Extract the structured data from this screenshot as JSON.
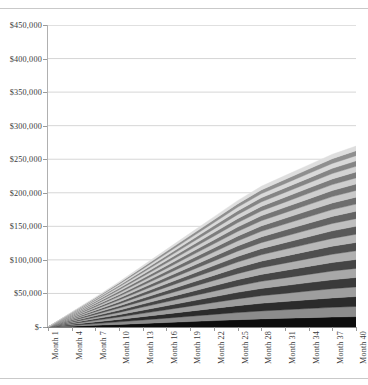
{
  "chart_data": {
    "type": "area",
    "stacked": true,
    "title": "",
    "subtitle": "",
    "xlabel": "",
    "ylabel": "",
    "grid": true,
    "grid_axis": "y",
    "legend_position": "none",
    "ylim": [
      0,
      450000
    ],
    "ytick_step": 50000,
    "ytick_labels": [
      "$450,000",
      "$400,000",
      "$350,000",
      "$300,000",
      "$250,000",
      "$200,000",
      "$150,000",
      "$100,000",
      "$50,000",
      "$-"
    ],
    "ytick_values": [
      450000,
      400000,
      350000,
      300000,
      250000,
      200000,
      150000,
      100000,
      50000,
      0
    ],
    "xtick_labels": [
      "Month 1",
      "Month 4",
      "Month 7",
      "Month 10",
      "Month 13",
      "Month 16",
      "Month 19",
      "Month 22",
      "Month 25",
      "Month 28",
      "Month 31",
      "Month 34",
      "Month 37",
      "Month 40"
    ],
    "xtick_values": [
      1,
      4,
      7,
      10,
      13,
      16,
      19,
      22,
      25,
      28,
      31,
      34,
      37,
      40
    ],
    "x_range": [
      1,
      40
    ],
    "x": [
      1,
      4,
      7,
      10,
      13,
      16,
      19,
      22,
      25,
      28,
      31,
      34,
      37,
      40
    ],
    "total_at_x": [
      0,
      30000,
      61000,
      93000,
      127000,
      162000,
      197000,
      233000,
      269000,
      302000,
      327000,
      352000,
      377000,
      398000
    ],
    "series_count": 24,
    "series_colors": [
      "#0d0d0d",
      "#8c8c8c",
      "#2b2b2b",
      "#9e9e9e",
      "#3a3a3a",
      "#a8a8a8",
      "#454545",
      "#b0b0b0",
      "#4f4f4f",
      "#b8b8b8",
      "#595959",
      "#bfbfbf",
      "#636363",
      "#c4c4c4",
      "#6d6d6d",
      "#c9c9c9",
      "#757575",
      "#cfcfcf",
      "#7d7d7d",
      "#d4d4d4",
      "#858585",
      "#d9d9d9",
      "#8f8f8f",
      "#dedede"
    ],
    "series": [
      {
        "name": "Series 1",
        "values": [
          0,
          1300,
          2600,
          3900,
          5300,
          6700,
          8100,
          9500,
          10900,
          12100,
          13000,
          13900,
          14800,
          15500
        ]
      },
      {
        "name": "Series 2",
        "values": [
          0,
          1250,
          2500,
          3780,
          5150,
          6520,
          7880,
          9250,
          10600,
          11800,
          12700,
          13600,
          14450,
          15150
        ]
      },
      {
        "name": "Series 3",
        "values": [
          0,
          1210,
          2420,
          3660,
          4990,
          6320,
          7640,
          8970,
          10300,
          11450,
          12320,
          13200,
          14050,
          14700
        ]
      },
      {
        "name": "Series 4",
        "values": [
          0,
          1180,
          2360,
          3570,
          4870,
          6160,
          7460,
          8750,
          10050,
          11180,
          12030,
          12880,
          13720,
          14360
        ]
      },
      {
        "name": "Series 5",
        "values": [
          0,
          1150,
          2300,
          3480,
          4740,
          6000,
          7260,
          8530,
          9790,
          10890,
          11720,
          12550,
          13370,
          13990
        ]
      },
      {
        "name": "Series 6",
        "values": [
          0,
          1120,
          2240,
          3390,
          4620,
          5850,
          7080,
          8310,
          9540,
          10610,
          11420,
          12230,
          13030,
          13630
        ]
      },
      {
        "name": "Series 7",
        "values": [
          0,
          1090,
          2180,
          3300,
          4490,
          5690,
          6880,
          8080,
          9280,
          10320,
          11110,
          11890,
          12670,
          13260
        ]
      },
      {
        "name": "Series 8",
        "values": [
          0,
          1060,
          2120,
          3210,
          4370,
          5530,
          6700,
          7860,
          9030,
          10040,
          10800,
          11570,
          12330,
          12900
        ]
      },
      {
        "name": "Series 9",
        "values": [
          0,
          1030,
          2060,
          3120,
          4240,
          5370,
          6500,
          7630,
          8760,
          9750,
          10490,
          11230,
          11970,
          12530
        ]
      },
      {
        "name": "Series 10",
        "values": [
          0,
          1000,
          2000,
          3030,
          4120,
          5210,
          6310,
          7400,
          8500,
          9460,
          10180,
          10900,
          11620,
          12170
        ]
      },
      {
        "name": "Series 11",
        "values": [
          0,
          970,
          1940,
          2940,
          3990,
          5050,
          6110,
          7180,
          8240,
          9180,
          9870,
          10570,
          11270,
          11800
        ]
      },
      {
        "name": "Series 12",
        "values": [
          0,
          940,
          1880,
          2850,
          3870,
          4900,
          5930,
          6960,
          7990,
          8890,
          9570,
          10250,
          10920,
          11440
        ]
      },
      {
        "name": "Series 13",
        "values": [
          0,
          910,
          1820,
          2760,
          3750,
          4740,
          5730,
          6720,
          7710,
          8590,
          9240,
          9890,
          10550,
          11050
        ]
      },
      {
        "name": "Series 14",
        "values": [
          0,
          880,
          1760,
          2670,
          3620,
          4580,
          5530,
          6490,
          7450,
          8300,
          8930,
          9560,
          10190,
          10680
        ]
      },
      {
        "name": "Series 15",
        "values": [
          0,
          850,
          1700,
          2580,
          3500,
          4420,
          5350,
          6270,
          7190,
          8010,
          8620,
          9230,
          9840,
          10310
        ]
      },
      {
        "name": "Series 16",
        "values": [
          0,
          820,
          1640,
          2490,
          3370,
          4260,
          5150,
          6040,
          6930,
          7720,
          8310,
          8900,
          9490,
          9940
        ]
      },
      {
        "name": "Series 17",
        "values": [
          0,
          790,
          1580,
          2400,
          3250,
          4100,
          4960,
          5810,
          6670,
          7430,
          8000,
          8560,
          9130,
          9570
        ]
      },
      {
        "name": "Series 18",
        "values": [
          0,
          760,
          1520,
          2310,
          3120,
          3940,
          4760,
          5580,
          6400,
          7140,
          7680,
          8230,
          8780,
          9200
        ]
      },
      {
        "name": "Series 19",
        "values": [
          0,
          730,
          1460,
          2220,
          3000,
          3790,
          4580,
          5360,
          6150,
          6850,
          7380,
          7900,
          8420,
          8830
        ]
      },
      {
        "name": "Series 20",
        "values": [
          0,
          700,
          1400,
          2130,
          2870,
          3630,
          4380,
          5130,
          5880,
          6560,
          7060,
          7560,
          8060,
          8450
        ]
      },
      {
        "name": "Series 21",
        "values": [
          0,
          670,
          1340,
          2040,
          2750,
          3470,
          4190,
          4900,
          5620,
          6270,
          6750,
          7230,
          7710,
          8080
        ]
      },
      {
        "name": "Series 22",
        "values": [
          0,
          640,
          1280,
          1950,
          2620,
          3310,
          3990,
          4680,
          5360,
          5980,
          6440,
          6890,
          7350,
          7710
        ]
      },
      {
        "name": "Series 23",
        "values": [
          0,
          610,
          1220,
          1860,
          2500,
          3150,
          3810,
          4450,
          5100,
          5690,
          6130,
          6560,
          7000,
          7340
        ]
      },
      {
        "name": "Series 24",
        "values": [
          0,
          580,
          1160,
          1770,
          2370,
          2990,
          3610,
          4220,
          4840,
          5400,
          5820,
          6230,
          6650,
          6970
        ]
      }
    ]
  }
}
